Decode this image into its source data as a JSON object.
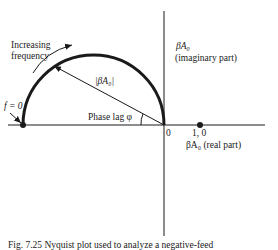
{
  "figure": {
    "caption": "Fig. 7.25 Nyquist plot used to analyze a negative-feed",
    "labels": {
      "increasing_line1": "Increasing",
      "increasing_line2": "frequency",
      "f_zero": "f = 0",
      "magnitude": "|βA₀|",
      "phase_lag": "Phase lag φ",
      "origin": "0",
      "one": "1, 0",
      "imag_axis_line1": "βA₀",
      "imag_axis_line2": "(imaginary part)",
      "real_axis": "βA₀ (real part)"
    },
    "colors": {
      "ink": "#1a1a1a",
      "background": "#ffffff"
    }
  }
}
